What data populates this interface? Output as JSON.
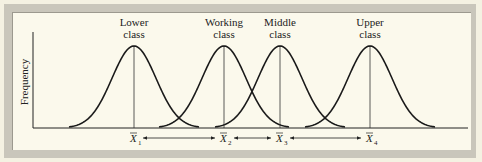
{
  "chart_data": {
    "type": "diagram-normal-curves",
    "ylabel": "Frequency",
    "xlabel": "",
    "curves": [
      {
        "name": "Lower class",
        "label_lines": [
          "Lower",
          "class"
        ],
        "mean_label": "X1",
        "peak_x": 134
      },
      {
        "name": "Working class",
        "label_lines": [
          "Working",
          "class"
        ],
        "mean_label": "X2",
        "peak_x": 224
      },
      {
        "name": "Middle class",
        "label_lines": [
          "Middle",
          "class"
        ],
        "mean_label": "X3",
        "peak_x": 280
      },
      {
        "name": "Upper class",
        "label_lines": [
          "Upper",
          "class"
        ],
        "mean_label": "X4",
        "peak_x": 370
      }
    ],
    "arrows": [
      {
        "from": "X1",
        "to": "X2"
      },
      {
        "from": "X2",
        "to": "X3"
      },
      {
        "from": "X3",
        "to": "X4"
      }
    ],
    "grid": false,
    "legend": "none"
  },
  "labels": {
    "ylabel": "Frequency",
    "c1a": "Lower",
    "c1b": "class",
    "c2a": "Working",
    "c2b": "class",
    "c3a": "Middle",
    "c3b": "class",
    "c4a": "Upper",
    "c4b": "class",
    "xbar": "X",
    "s1": "1",
    "s2": "2",
    "s3": "3",
    "s4": "4"
  },
  "colors": {
    "ink": "#1a1a1a",
    "panel": "#fbf9ec",
    "frame": "#c9c6bb"
  }
}
